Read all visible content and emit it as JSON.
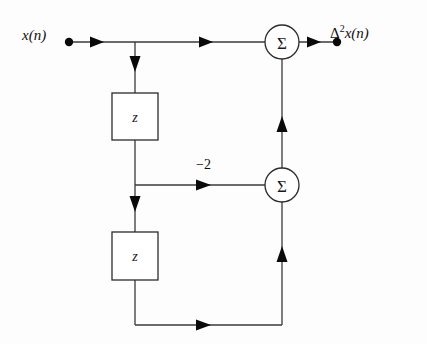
{
  "diagram": {
    "background_color": "#fdfdfd",
    "line_color": "#3a3a3a",
    "text_color": "#101010",
    "labels": {
      "input": "x(n)",
      "output_delta": "Δ",
      "output_exponent": "2",
      "output_signal": "x(n)",
      "gain": "−2",
      "delay_1": "z",
      "delay_2": "z",
      "sum_symbol_top": "Σ",
      "sum_symbol_bottom": "Σ"
    },
    "nodes": [
      {
        "id": "input-terminal",
        "type": "terminal-dot",
        "x": 69,
        "y": 42
      },
      {
        "id": "output-terminal",
        "type": "terminal-dot",
        "x": 337,
        "y": 42
      },
      {
        "id": "delay-block-1",
        "type": "box",
        "x": 112,
        "y": 93,
        "w": 46,
        "h": 47,
        "label": "z"
      },
      {
        "id": "delay-block-2",
        "type": "box",
        "x": 112,
        "y": 232,
        "w": 46,
        "h": 48,
        "label": "z"
      },
      {
        "id": "adder-top",
        "type": "circle",
        "cx": 282,
        "cy": 42,
        "r": 17,
        "label": "Σ"
      },
      {
        "id": "adder-bottom",
        "type": "circle",
        "cx": 282,
        "cy": 185,
        "r": 17,
        "label": "Σ"
      }
    ],
    "branch_points": [
      {
        "id": "branch-input",
        "x": 135,
        "y": 42
      },
      {
        "id": "branch-mid",
        "x": 135,
        "y": 185
      }
    ],
    "edges": [
      {
        "id": "edge-input-to-adder-top",
        "from": "input-terminal",
        "to": "adder-top",
        "direction": "right"
      },
      {
        "id": "edge-input-to-delay1",
        "from": "branch-input",
        "to": "delay-block-1",
        "direction": "down"
      },
      {
        "id": "edge-delay1-to-branch-mid",
        "from": "delay-block-1",
        "to": "branch-mid",
        "direction": "down"
      },
      {
        "id": "edge-gain-to-adder-bottom",
        "from": "branch-mid",
        "to": "adder-bottom",
        "direction": "right",
        "gain": "−2"
      },
      {
        "id": "edge-branch-mid-to-delay2",
        "from": "branch-mid",
        "to": "delay-block-2",
        "direction": "down"
      },
      {
        "id": "edge-delay2-feedback",
        "from": "delay-block-2",
        "to": "adder-bottom",
        "direction": "right"
      },
      {
        "id": "edge-adder-bottom-to-adder-top",
        "from": "adder-bottom",
        "to": "adder-top",
        "direction": "up"
      },
      {
        "id": "edge-adder-top-to-output",
        "from": "adder-top",
        "to": "output-terminal",
        "direction": "right"
      }
    ]
  }
}
